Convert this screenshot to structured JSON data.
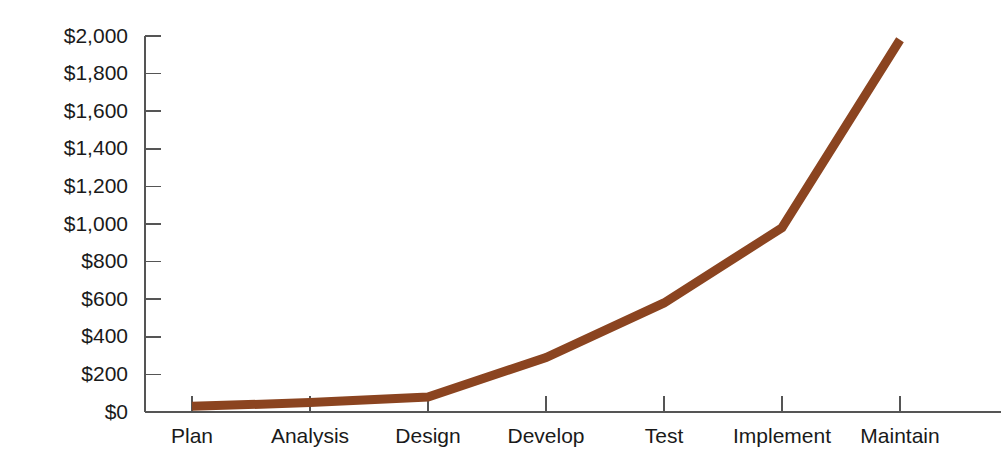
{
  "chart_data": {
    "type": "line",
    "title": "",
    "subtitle": "",
    "xlabel": "",
    "ylabel": "",
    "categories": [
      "Plan",
      "Analysis",
      "Design",
      "Develop",
      "Test",
      "Implement",
      "Maintain"
    ],
    "values": [
      30,
      50,
      80,
      290,
      580,
      980,
      1980
    ],
    "series": [
      {
        "name": "Cost",
        "color": "#8B4420",
        "values": [
          30,
          50,
          80,
          290,
          580,
          980,
          1980
        ]
      }
    ],
    "ylim": [
      0,
      2000
    ],
    "ytick_values": [
      0,
      200,
      400,
      600,
      800,
      1000,
      1200,
      1400,
      1600,
      1800,
      2000
    ],
    "ytick_labels": [
      "$0",
      "$200",
      "$400",
      "$600",
      "$800",
      "$1,000",
      "$1,200",
      "$1,400",
      "$1,600",
      "$1,800",
      "$2,000"
    ],
    "xtick_labels": [
      "Plan",
      "Analysis",
      "Design",
      "Develop",
      "Test",
      "Implement",
      "Maintain"
    ],
    "grid": false,
    "legend": false,
    "legend_position": "none",
    "annotations": []
  },
  "colors": {
    "line": "#8B4420",
    "axis": "#555555",
    "text": "#1a1a1a",
    "background": "#ffffff"
  },
  "geometry": {
    "plot_left": 145,
    "plot_right": 1001,
    "plot_top": 36,
    "plot_bottom": 412,
    "x_first_tick": 192,
    "x_tick_spacing": 118,
    "y_label_right": 128,
    "tick_length": 16,
    "line_width": 9
  }
}
